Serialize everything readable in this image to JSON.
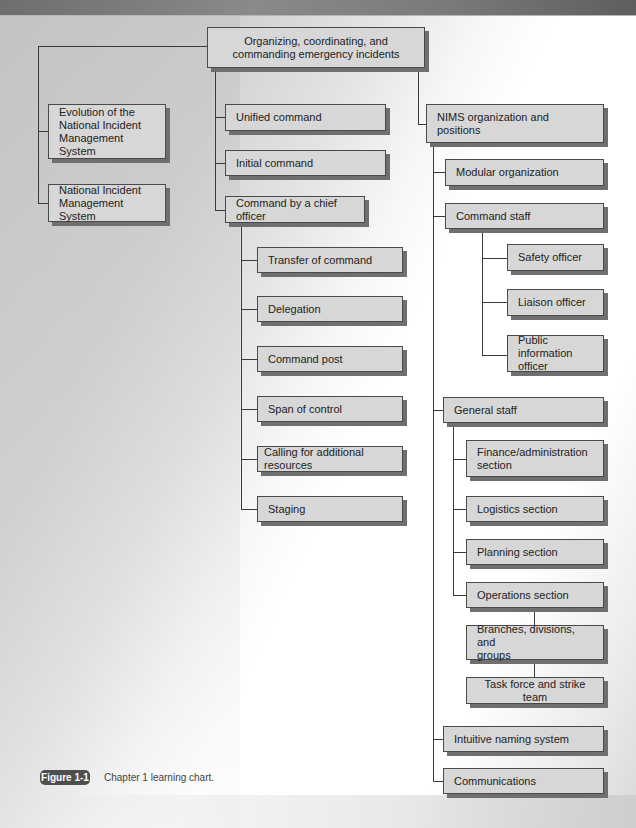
{
  "diagram": {
    "root": "Organizing, coordinating, and\ncommanding emergency incidents",
    "left_branch": [
      "Evolution of the\nNational Incident\nManagement System",
      "National Incident\nManagement System"
    ],
    "middle_branch": {
      "items": [
        "Unified command",
        "Initial command",
        "Command by a chief officer"
      ],
      "chief_officer_children": [
        "Transfer of command",
        "Delegation",
        "Command post",
        "Span of control",
        "Calling for additional resources",
        "Staging"
      ]
    },
    "right_branch": {
      "title": "NIMS organization and positions",
      "modular": "Modular organization",
      "command_staff": {
        "label": "Command staff",
        "children": [
          "Safety officer",
          "Liaison officer",
          "Public information\nofficer"
        ]
      },
      "general_staff": {
        "label": "General staff",
        "children": [
          "Finance/administration\nsection",
          "Logistics section",
          "Planning section",
          "Operations section"
        ],
        "operations_chain": [
          "Branches, divisions, and\ngroups",
          "Task force and strike team"
        ]
      },
      "intuitive": "Intuitive naming system",
      "communications": "Communications"
    }
  },
  "figure": {
    "label": "Figure 1-1",
    "caption": "Chapter 1 learning chart."
  }
}
